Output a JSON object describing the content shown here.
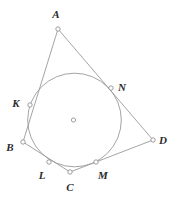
{
  "figure": {
    "canvas": {
      "width": 173,
      "height": 199
    },
    "stroke_color": "#9a9a9a",
    "label_color": "#2b2b2b",
    "marker_fill": "#ffffff",
    "background": "#ffffff"
  },
  "circle": {
    "name": "incircle",
    "cx": 74.5,
    "cy": 120,
    "r": 46.8,
    "center_marker": {
      "cx": 73.5,
      "cy": 120,
      "r": 2.1
    }
  },
  "vertices": [
    {
      "id": "A",
      "label": "A",
      "x": 58,
      "y": 29,
      "label_x": 56,
      "label_y": 14
    },
    {
      "id": "B",
      "label": "B",
      "x": 23,
      "y": 142,
      "label_x": 10,
      "label_y": 147
    },
    {
      "id": "C",
      "label": "C",
      "x": 70,
      "y": 172,
      "label_x": 70,
      "label_y": 187
    },
    {
      "id": "D",
      "label": "D",
      "x": 153,
      "y": 140,
      "label_x": 163,
      "label_y": 140
    }
  ],
  "tangency_points": [
    {
      "id": "K",
      "label": "K",
      "x": 30,
      "y": 105,
      "label_x": 16,
      "label_y": 103,
      "side": "AB"
    },
    {
      "id": "L",
      "label": "L",
      "x": 49,
      "y": 162,
      "label_x": 42,
      "label_y": 175,
      "side": "BC"
    },
    {
      "id": "M",
      "label": "M",
      "x": 96,
      "y": 162,
      "label_x": 103,
      "label_y": 175,
      "side": "CD"
    },
    {
      "id": "N",
      "label": "N",
      "x": 111,
      "y": 88,
      "label_x": 122,
      "label_y": 87,
      "side": "DA"
    }
  ],
  "edges": [
    {
      "id": "AB",
      "from": "A",
      "to": "B",
      "x1": 58,
      "y1": 29,
      "x2": 23,
      "y2": 142
    },
    {
      "id": "BC",
      "from": "B",
      "to": "C",
      "x1": 23,
      "y1": 142,
      "x2": 70,
      "y2": 172
    },
    {
      "id": "CD",
      "from": "C",
      "to": "D",
      "x1": 70,
      "y1": 172,
      "x2": 153,
      "y2": 140
    },
    {
      "id": "DA",
      "from": "D",
      "to": "A",
      "x1": 153,
      "y1": 140,
      "x2": 58,
      "y2": 29
    }
  ]
}
